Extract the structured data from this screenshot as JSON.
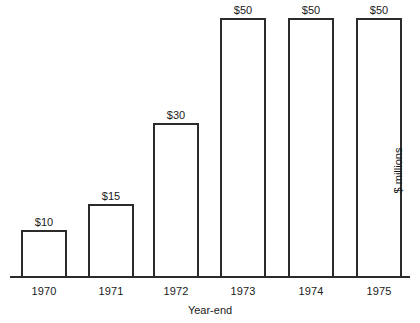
{
  "chart_data": {
    "type": "bar",
    "title": "",
    "subtitle": "",
    "xlabel": "Year-end",
    "ylabel": "$ millions",
    "categories": [
      "1970",
      "1971",
      "1972",
      "1973",
      "1974",
      "1975"
    ],
    "values": [
      10,
      15,
      30,
      50,
      50,
      50
    ],
    "data_labels": [
      "$10",
      "$15",
      "$30",
      "$50",
      "$50",
      "$50"
    ],
    "ylim": [
      0,
      50
    ],
    "grid": false,
    "legend": false,
    "legend_position": "none",
    "axis_baseline_visible": true,
    "y_axis_ticks_visible": false,
    "value_prefix": "$",
    "units": "millions",
    "bar_style": {
      "fill_color": "#ffffff",
      "edge_color": "#2b2b2b",
      "edge_width_px": 2
    },
    "background_color": "#ffffff",
    "text_color": "#1a1a1a"
  },
  "chart": {
    "x_axis_title": "Year-end",
    "y_axis_title": "$ millions",
    "bars": [
      {
        "category": "1970",
        "value": 10,
        "label": "$10",
        "left_px": 21,
        "width_px": 46,
        "top_px": 230
      },
      {
        "category": "1971",
        "value": 15,
        "label": "$15",
        "left_px": 88,
        "width_px": 46,
        "top_px": 204
      },
      {
        "category": "1972",
        "value": 30,
        "label": "$30",
        "left_px": 153,
        "width_px": 46,
        "top_px": 123
      },
      {
        "category": "1973",
        "value": 50,
        "label": "$50",
        "left_px": 220,
        "width_px": 46,
        "top_px": 18
      },
      {
        "category": "1974",
        "value": 50,
        "label": "$50",
        "left_px": 288,
        "width_px": 46,
        "top_px": 18
      },
      {
        "category": "1975",
        "value": 50,
        "label": "$50",
        "left_px": 356,
        "width_px": 46,
        "top_px": 18
      }
    ]
  }
}
